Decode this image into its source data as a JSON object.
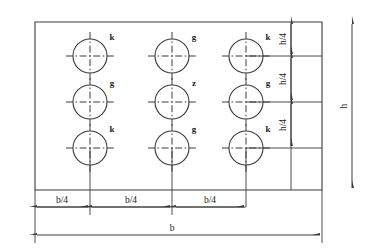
{
  "drawing": {
    "title": "Plate hole pattern layout",
    "background_color": "#ffffff",
    "line_color": "#3a3a3a",
    "text_color": "#1a1a1a",
    "outline": {
      "label": "plate-outline"
    },
    "holes": [
      {
        "id": "hole-r1c1",
        "label": "k",
        "row": 1,
        "col": 1,
        "cx": 90,
        "cy": 56,
        "r": 17
      },
      {
        "id": "hole-r1c2",
        "label": "g",
        "row": 1,
        "col": 2,
        "cx": 172,
        "cy": 56,
        "r": 17
      },
      {
        "id": "hole-r1c3",
        "label": "k",
        "row": 1,
        "col": 3,
        "cx": 246,
        "cy": 56,
        "r": 17
      },
      {
        "id": "hole-r2c1",
        "label": "g",
        "row": 2,
        "col": 1,
        "cx": 90,
        "cy": 102,
        "r": 17
      },
      {
        "id": "hole-r2c2",
        "label": "z",
        "row": 2,
        "col": 2,
        "cx": 172,
        "cy": 102,
        "r": 17
      },
      {
        "id": "hole-r2c3",
        "label": "g",
        "row": 2,
        "col": 3,
        "cx": 246,
        "cy": 102,
        "r": 17
      },
      {
        "id": "hole-r3c1",
        "label": "k",
        "row": 3,
        "col": 1,
        "cx": 90,
        "cy": 148,
        "r": 17
      },
      {
        "id": "hole-r3c2",
        "label": "g",
        "row": 3,
        "col": 2,
        "cx": 172,
        "cy": 148,
        "r": 17
      },
      {
        "id": "hole-r3c3",
        "label": "k",
        "row": 3,
        "col": 3,
        "cx": 246,
        "cy": 148,
        "r": 17
      }
    ],
    "vertical_dimensions": {
      "segments": [
        {
          "id": "dim-h4-top",
          "label": "h/4",
          "from_y": 22,
          "to_y": 56
        },
        {
          "id": "dim-h4-middle",
          "label": "h/4",
          "from_y": 56,
          "to_y": 102
        },
        {
          "id": "dim-h4-bottom",
          "label": "h/4",
          "from_y": 102,
          "to_y": 148
        }
      ],
      "overall": {
        "id": "dim-h-overall",
        "label": "h",
        "from_y": 22,
        "to_y": 190
      }
    },
    "horizontal_dimensions": {
      "segments": [
        {
          "id": "dim-b4-left",
          "label": "b/4",
          "from_x": 35,
          "to_x": 90
        },
        {
          "id": "dim-b4-center",
          "label": "b/4",
          "from_x": 90,
          "to_x": 172
        },
        {
          "id": "dim-b4-right",
          "label": "b/4",
          "from_x": 172,
          "to_x": 246
        }
      ],
      "overall": {
        "id": "dim-b-overall",
        "label": "b",
        "from_x": 35,
        "to_x": 322
      }
    }
  }
}
